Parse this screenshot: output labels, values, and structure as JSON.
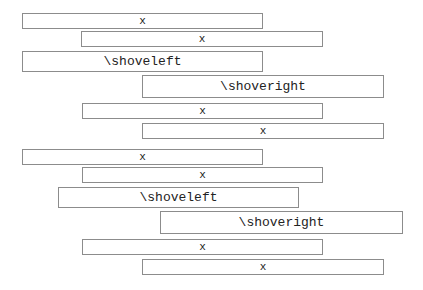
{
  "diagram": {
    "title": "",
    "groups": [
      {
        "name": "group-1",
        "rows": [
          {
            "label": "x",
            "x": 22,
            "y": 13,
            "w": 241,
            "h": 16,
            "size": "small"
          },
          {
            "label": "x",
            "x": 81,
            "y": 31,
            "w": 242,
            "h": 16,
            "size": "small"
          },
          {
            "label": "\\shoveleft",
            "x": 22,
            "y": 51,
            "w": 241,
            "h": 21,
            "size": "big"
          },
          {
            "label": "\\shoveright",
            "x": 142,
            "y": 75,
            "w": 242,
            "h": 23,
            "size": "big"
          },
          {
            "label": "x",
            "x": 82,
            "y": 103,
            "w": 241,
            "h": 16,
            "size": "small"
          },
          {
            "label": "x",
            "x": 142,
            "y": 123,
            "w": 242,
            "h": 16,
            "size": "small"
          }
        ]
      },
      {
        "name": "group-2",
        "rows": [
          {
            "label": "x",
            "x": 22,
            "y": 149,
            "w": 241,
            "h": 16,
            "size": "small"
          },
          {
            "label": "x",
            "x": 82,
            "y": 167,
            "w": 241,
            "h": 16,
            "size": "small"
          },
          {
            "label": "\\shoveleft",
            "x": 58,
            "y": 187,
            "w": 241,
            "h": 21,
            "size": "big"
          },
          {
            "label": "\\shoveright",
            "x": 160,
            "y": 211,
            "w": 243,
            "h": 23,
            "size": "big"
          },
          {
            "label": "x",
            "x": 82,
            "y": 239,
            "w": 241,
            "h": 16,
            "size": "small"
          },
          {
            "label": "x",
            "x": 142,
            "y": 259,
            "w": 242,
            "h": 16,
            "size": "small"
          }
        ]
      }
    ],
    "colors": {
      "border": "#8c8c8c",
      "text": "#222222",
      "background": "#ffffff"
    }
  }
}
